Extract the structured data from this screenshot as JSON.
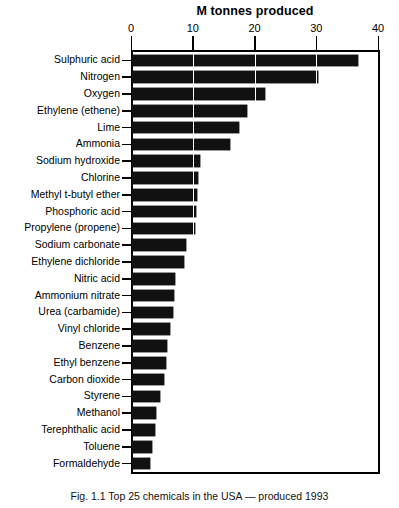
{
  "figure": {
    "caption": "Fig. 1.1 Top 25 chemicals in the USA — produced 1993"
  },
  "chart_data": {
    "type": "bar",
    "orientation": "horizontal",
    "title": "M tonnes produced",
    "xlabel": "M tonnes produced",
    "ylabel": "",
    "xlim": [
      0,
      40
    ],
    "xticks": [
      0,
      10,
      20,
      30,
      40
    ],
    "xtick_labels": [
      "0",
      "10",
      "20",
      "30",
      "40"
    ],
    "grid": "vertical-white-overlay",
    "legend": "none",
    "bar_color": "#111111",
    "categories": [
      "Sulphuric acid",
      "Nitrogen",
      "Oxygen",
      "Ethylene (ethene)",
      "Lime",
      "Ammonia",
      "Sodium hydroxide",
      "Chlorine",
      "Methyl t-butyl ether",
      "Phosphoric acid",
      "Propylene (propene)",
      "Sodium carbonate",
      "Ethylene dichloride",
      "Nitric acid",
      "Ammonium nitrate",
      "Urea (carbamide)",
      "Vinyl chloride",
      "Benzene",
      "Ethyl benzene",
      "Carbon dioxide",
      "Styrene",
      "Methanol",
      "Terephthalic acid",
      "Toluene",
      "Formaldehyde"
    ],
    "values": [
      36.6,
      30.2,
      21.5,
      18.7,
      17.4,
      15.8,
      11.0,
      10.7,
      10.5,
      10.3,
      10.2,
      8.7,
      8.4,
      6.9,
      6.8,
      6.6,
      6.2,
      5.6,
      5.5,
      5.2,
      4.5,
      3.9,
      3.7,
      3.2,
      2.9
    ]
  }
}
